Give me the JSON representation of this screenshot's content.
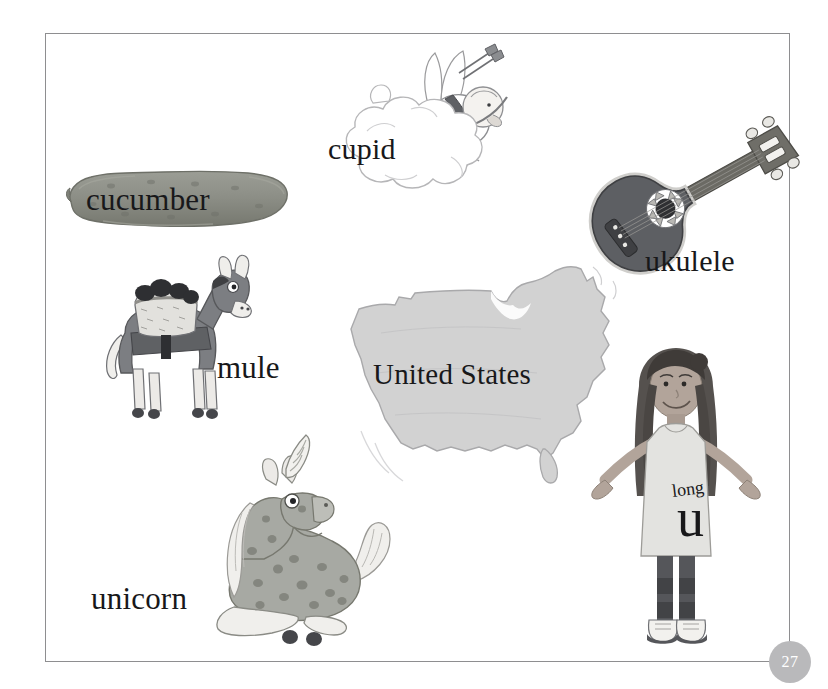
{
  "page": {
    "number": "27",
    "background_color": "#ffffff",
    "frame_color": "#8e8e90",
    "badge_color": "#b9b9bb",
    "text_color": "#18181a"
  },
  "items": [
    {
      "id": "cucumber",
      "label": "cucumber",
      "icon": "cucumber-illustration",
      "fill": "#8d8f87"
    },
    {
      "id": "cupid",
      "label": "cupid",
      "icon": "cupid-on-cloud-illustration",
      "fill": "#ffffff"
    },
    {
      "id": "ukulele",
      "label": "ukulele",
      "icon": "ukulele-illustration",
      "fill": "#5d5f63"
    },
    {
      "id": "mule",
      "label": "mule",
      "icon": "mule-with-pack-illustration",
      "fill": "#7c7e82"
    },
    {
      "id": "united-states",
      "label": "United States",
      "icon": "united-states-map-illustration",
      "fill": "#d2d2d2"
    },
    {
      "id": "unicorn",
      "label": "unicorn",
      "icon": "unicorn-illustration",
      "fill": "#a7a9a3"
    }
  ],
  "girl": {
    "icon": "girl-illustration",
    "shirt_small_text": "long",
    "shirt_large_text": "u",
    "dress_color": "#e3e3e0",
    "skin_color": "#b2a49a",
    "hair_color": "#55514e",
    "leggings_color": "#55565a"
  }
}
